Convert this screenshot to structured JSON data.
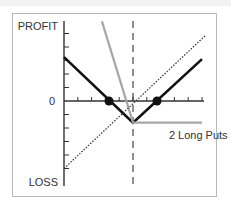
{
  "chart_data": {
    "type": "line",
    "title": "",
    "xlabel": "",
    "ylabel": "",
    "y_top_label": "PROFIT",
    "y_bottom_label": "LOSS",
    "y_zero_label": "0",
    "xlim": [
      0,
      10
    ],
    "ylim": [
      -6.3,
      6.0
    ],
    "x_ticks": [
      1,
      2,
      3,
      4,
      5,
      6,
      7,
      8,
      9,
      10
    ],
    "y_ticks": [
      -5,
      -4,
      -3,
      -2,
      -1,
      1,
      2,
      3,
      4,
      5
    ],
    "grid": false,
    "legend": "none",
    "strike": 5,
    "series": [
      {
        "name": "Combined position (stock + 2 long puts)",
        "style": "solid",
        "color": "#111111",
        "points": [
          [
            0,
            3.25
          ],
          [
            5,
            -1.6
          ],
          [
            10,
            3.1
          ]
        ]
      },
      {
        "name": "2 Long Puts",
        "style": "solid",
        "color": "#a6a6a6",
        "points": [
          [
            2.75,
            5.9
          ],
          [
            5,
            -1.6
          ],
          [
            10,
            -1.6
          ]
        ]
      },
      {
        "name": "Long stock",
        "style": "dotted",
        "color": "#333333",
        "points": [
          [
            0,
            -5.0
          ],
          [
            10.3,
            4.9
          ]
        ]
      }
    ],
    "markers": [
      {
        "name": "lower-breakeven",
        "x": 3.26,
        "y": 0
      },
      {
        "name": "upper-breakeven",
        "x": 6.74,
        "y": 0
      }
    ],
    "annotations": [
      {
        "text": "2 Long Puts",
        "x": 7.6,
        "y": -2.5
      }
    ]
  },
  "colors": {
    "frame_border": "#b8b8b8",
    "axis": "#333333",
    "combined_line": "#111111",
    "puts_line": "#a6a6a6",
    "stock_line": "#333333",
    "strike_line": "#444444"
  }
}
